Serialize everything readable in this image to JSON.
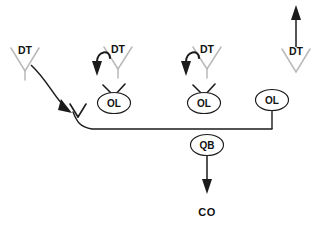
{
  "diagram": {
    "canvas": {
      "width": 319,
      "height": 231,
      "background": "#ffffff"
    },
    "colors": {
      "ink": "#1b1b1b",
      "chevron_gray": "#b9b9b9",
      "background": "#ffffff"
    },
    "defenders": [
      {
        "id": "dt-left",
        "label": "DT",
        "icon": "chevron-down-icon",
        "x": 25,
        "y": 58,
        "movement": "curved-arrow-down-right"
      },
      {
        "id": "dt-inside-left",
        "label": "DT",
        "icon": "chevron-down-icon",
        "x": 118,
        "y": 56,
        "movement": "hook-arrow-down-left"
      },
      {
        "id": "dt-inside-right",
        "label": "DT",
        "icon": "chevron-down-icon",
        "x": 207,
        "y": 56,
        "movement": "hook-arrow-down-left"
      },
      {
        "id": "dt-right",
        "label": "DT",
        "icon": "chevron-down-icon",
        "x": 296,
        "y": 58,
        "movement": "straight-arrow-up"
      }
    ],
    "blockers": [
      {
        "id": "ol-left",
        "label": "OL",
        "x": 114,
        "y": 103,
        "has_block_mark": true,
        "has_stem": false
      },
      {
        "id": "ol-middle",
        "label": "OL",
        "x": 204,
        "y": 103,
        "has_block_mark": true,
        "has_stem": false
      },
      {
        "id": "ol-right",
        "label": "OL",
        "x": 272,
        "y": 100,
        "has_block_mark": false,
        "has_stem": true
      }
    ],
    "quarterback": {
      "id": "qb",
      "label": "QB",
      "x": 207,
      "y": 145,
      "movement": "straight-arrow-down"
    },
    "target": {
      "id": "co",
      "label": "CO",
      "x": 207,
      "y": 213
    },
    "protection_line": {
      "id": "slide-protection-line",
      "description": "horizontal protection line from left block point to right OL stem",
      "x_start": 78,
      "x_end": 272,
      "y": 130
    },
    "left_block_mark": {
      "id": "left-block-point",
      "x": 78,
      "y": 118
    }
  }
}
